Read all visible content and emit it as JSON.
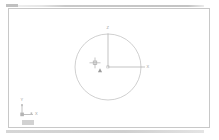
{
  "app": {
    "name": "CAD Drawing Editor",
    "workspace_label": "Drawing Area"
  },
  "toolbar": {
    "top_label": "",
    "bottom_label": ""
  },
  "canvas": {
    "label": "Model Space",
    "background_color": "#ffffff",
    "border_color": "#c8c8c8",
    "geometry_color": "#b5b5b5",
    "axis_color": "#a8a8a8",
    "cursor_color": "#9a9a9a",
    "label_color": "#9a9a9a"
  },
  "drawing": {
    "circle": {
      "name": "circle",
      "center_x": 108,
      "center_y": 67,
      "radius": 33,
      "label": ""
    },
    "axis_vertical": {
      "label": "Z",
      "from_x": 108,
      "from_y": 67,
      "to_x": 108,
      "to_y": 34
    },
    "axis_horizontal": {
      "label": "X",
      "from_x": 108,
      "from_y": 67,
      "to_x": 145,
      "to_y": 67
    },
    "center_marker": {
      "label": "",
      "x": 108,
      "y": 67
    },
    "cursor": {
      "label": "",
      "x": 95,
      "y": 63
    },
    "snap_marker": {
      "label": "",
      "x": 100,
      "y": 71
    }
  },
  "ucs_icon": {
    "label": "UCS",
    "x_label": "X",
    "y_label": "Y",
    "origin_x": 22,
    "origin_y": 114
  }
}
